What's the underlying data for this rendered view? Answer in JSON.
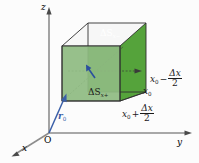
{
  "figure": {
    "type": "3d-vector-diagram",
    "background": "#fcfcfc"
  },
  "axes": {
    "origin_label": "O",
    "x_label": "x",
    "y_label": "y",
    "z_label": "z",
    "color": "#888888"
  },
  "vector": {
    "name": "r0",
    "symbol": "r",
    "subscript": "0",
    "color": "#3a5fa8",
    "from": "O",
    "to": "cube-front-bottom-left-corner"
  },
  "normal_arrow": {
    "name": "surface-normal",
    "color": "#2b4f9e"
  },
  "cube": {
    "face_back_label_symbol": "ΔS",
    "face_back_sub_var": "x",
    "face_back_sub_sign": "−",
    "face_front_label_symbol": "ΔS",
    "face_front_sub_var": "x",
    "face_front_sub_sign": "+",
    "color_dark": "#4a9b32",
    "color_mid": "#6aab4e",
    "color_light": "#8fbb82",
    "edge_color": "#2f2f2f"
  },
  "coordinate_labels": {
    "minus": {
      "base": "x",
      "base_sub": "0",
      "op": "−",
      "num": "Δx",
      "den": "2"
    },
    "center": {
      "base": "x",
      "base_sub": "0"
    },
    "plus": {
      "base": "x",
      "base_sub": "0",
      "op": "+",
      "num": "Δx",
      "den": "2"
    }
  }
}
